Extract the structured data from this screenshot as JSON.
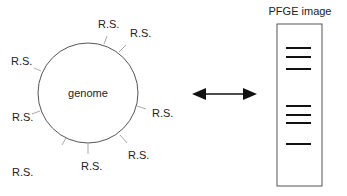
{
  "genome": {
    "label": "genome",
    "center": [
      88,
      93
    ],
    "radius": 50,
    "sites": [
      {
        "label": "R.S.",
        "tick": [
          [
            104,
            44
          ],
          [
            107,
            36
          ]
        ],
        "text": [
          98,
          28
        ]
      },
      {
        "label": "R.S.",
        "tick": [
          [
            119,
            52
          ],
          [
            126,
            45
          ]
        ],
        "text": [
          130,
          37
        ]
      },
      {
        "label": "R.S.",
        "tick": [
          [
            41,
            71
          ],
          [
            34,
            68
          ]
        ],
        "text": [
          11,
          65
        ]
      },
      {
        "label": "R.S.",
        "tick": [
          [
            137,
            106
          ],
          [
            146,
            109
          ]
        ],
        "text": [
          152,
          117
        ]
      },
      {
        "label": "R.S.",
        "tick": [
          [
            40,
            111
          ],
          [
            32,
            114
          ]
        ],
        "text": [
          12,
          121
        ]
      },
      {
        "label": "R.S.",
        "tick": [
          [
            120,
            135
          ],
          [
            127,
            143
          ]
        ],
        "text": [
          128,
          159
        ]
      },
      {
        "label": "R.S.",
        "tick": [
          [
            88,
            144
          ],
          [
            88,
            154
          ]
        ],
        "text": [
          81,
          170
        ]
      },
      {
        "label": "R.S.",
        "tick": [
          [
            66,
            138
          ],
          [
            62,
            145
          ]
        ],
        "text": [
          12,
          176
        ]
      }
    ]
  },
  "arrow": {
    "x1": 192,
    "x2": 257,
    "y": 94
  },
  "pfge": {
    "title": "PFGE image",
    "box": {
      "x": 277,
      "y": 24,
      "w": 45,
      "h": 162
    },
    "band_x": [
      286,
      311
    ],
    "bands": [
      48,
      57,
      69,
      106,
      115,
      123,
      144
    ]
  }
}
